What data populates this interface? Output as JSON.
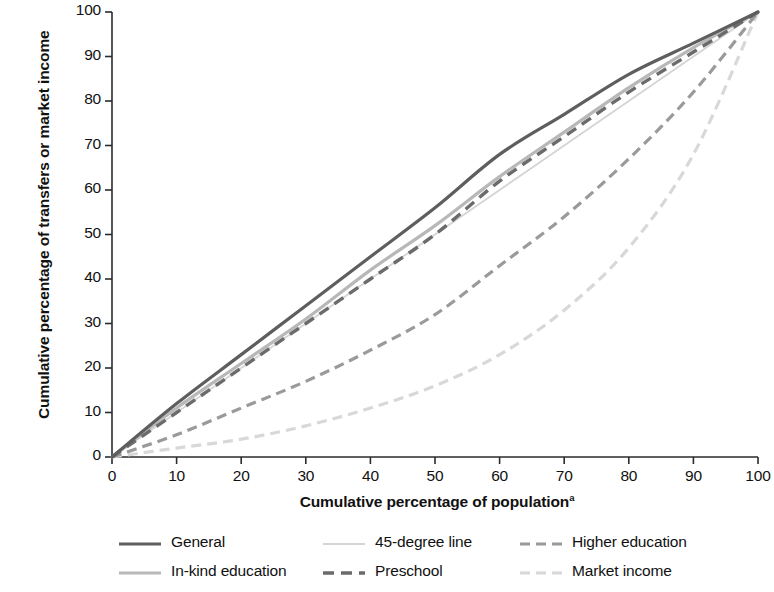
{
  "chart_data": {
    "type": "line",
    "title": "",
    "xlabel": "Cumulative percentage of population",
    "xlabel_superscript": "a",
    "ylabel": "Cumulative percentage of transfers or market income",
    "xlim": [
      0,
      100
    ],
    "ylim": [
      0,
      100
    ],
    "xticks": [
      "0",
      "10",
      "20",
      "30",
      "40",
      "50",
      "60",
      "70",
      "80",
      "90",
      "100"
    ],
    "yticks": [
      "0",
      "10",
      "20",
      "30",
      "40",
      "50",
      "60",
      "70",
      "80",
      "90",
      "100"
    ],
    "grid": false,
    "legend_position": "bottom",
    "x": [
      0,
      10,
      20,
      30,
      40,
      50,
      60,
      70,
      80,
      90,
      100
    ],
    "series": [
      {
        "name": "General",
        "color": "#5e5e5e",
        "dash": "solid",
        "width": 3.2,
        "values": [
          0,
          12,
          23,
          34,
          45,
          56,
          68,
          77,
          86,
          93,
          100
        ]
      },
      {
        "name": "In-kind education",
        "color": "#b8b8b8",
        "dash": "solid",
        "width": 3.2,
        "values": [
          0,
          11,
          21,
          31,
          42,
          52,
          63,
          73,
          83,
          92,
          100
        ]
      },
      {
        "name": "45-degree line",
        "color": "#d4d4d4",
        "dash": "solid",
        "width": 1.8,
        "values": [
          0,
          10,
          20,
          30,
          40,
          50,
          60,
          70,
          80,
          90,
          100
        ]
      },
      {
        "name": "Preschool",
        "color": "#6b6b6b",
        "dash": "dashed",
        "width": 3.4,
        "values": [
          0,
          10,
          20,
          30,
          40,
          50,
          62,
          72,
          82,
          91,
          100
        ]
      },
      {
        "name": "Higher education",
        "color": "#9a9a9a",
        "dash": "dashed",
        "width": 3.2,
        "values": [
          0,
          5,
          11,
          17,
          24,
          32,
          43,
          54,
          67,
          82,
          100
        ]
      },
      {
        "name": "Market income",
        "color": "#d8d8d8",
        "dash": "dashed",
        "width": 3.2,
        "values": [
          0,
          2,
          4,
          7,
          11,
          16,
          23,
          33,
          47,
          68,
          100
        ]
      }
    ]
  },
  "legend": {
    "rows": [
      [
        {
          "label": "General",
          "key": "general"
        },
        {
          "label": "45-degree line",
          "key": "forty-five-degree-line"
        },
        {
          "label": "Higher education",
          "key": "higher-education"
        }
      ],
      [
        {
          "label": "In-kind education",
          "key": "in-kind-education"
        },
        {
          "label": "Preschool",
          "key": "preschool"
        },
        {
          "label": "Market income",
          "key": "market-income"
        }
      ]
    ]
  },
  "colors": {
    "general": "#5e5e5e",
    "in_kind_education": "#b8b8b8",
    "forty_five_degree_line": "#d4d4d4",
    "preschool": "#6b6b6b",
    "higher_education": "#9a9a9a",
    "market_income": "#d8d8d8",
    "axis": "#2b2b2b",
    "text": "#111111"
  }
}
